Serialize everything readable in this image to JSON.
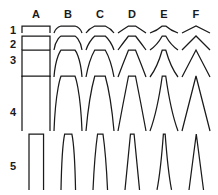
{
  "figure": {
    "background_color": "#ffffff",
    "stroke_color": "#1a1a1a",
    "columns": [
      {
        "label": "A",
        "x": 22,
        "width": 28,
        "shape": "rectangular-pulse",
        "flatness": 1.0
      },
      {
        "label": "B",
        "x": 54,
        "width": 28,
        "shape": "flat-topped-arch",
        "flatness": 0.8
      },
      {
        "label": "C",
        "x": 86,
        "width": 28,
        "shape": "rounded-arch",
        "flatness": 0.6
      },
      {
        "label": "D",
        "x": 118,
        "width": 28,
        "shape": "parabolic-arch",
        "flatness": 0.4
      },
      {
        "label": "E",
        "x": 150,
        "width": 28,
        "shape": "pointed-arch",
        "flatness": 0.2
      },
      {
        "label": "F",
        "x": 182,
        "width": 28,
        "shape": "triangular-peak",
        "flatness": 0.0
      }
    ],
    "rows": [
      {
        "label": "1",
        "label_y": 24,
        "baseline_y": 33,
        "height": 7,
        "width_factor": 1.0
      },
      {
        "label": "2",
        "label_y": 38,
        "baseline_y": 50,
        "height": 14,
        "width_factor": 1.0
      },
      {
        "label": "3",
        "label_y": 54,
        "baseline_y": 77,
        "height": 27,
        "width_factor": 1.0
      },
      {
        "label": "4",
        "label_y": 106,
        "baseline_y": 131,
        "height": 55,
        "width_factor": 1.0
      },
      {
        "label": "5",
        "label_y": 160,
        "baseline_y": 190,
        "height": 56,
        "width_factor": 0.52
      }
    ],
    "header_y": 8
  }
}
